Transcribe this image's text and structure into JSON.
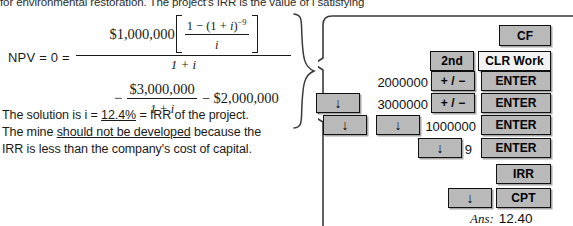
{
  "document": {
    "intro_line": "for environmental restoration. The project's IRR is the value of i satisfying",
    "equation": {
      "lhs": "NPV = 0 =",
      "numerator_coefficient": "$1,000,000",
      "bracket_numerator_prefix": "1 − (1 + ",
      "bracket_numerator_var": "i",
      "bracket_numerator_suffix": ")",
      "bracket_exponent": "−9",
      "bracket_denominator": "i",
      "main_denominator": "1 + i",
      "minus_sign": "−",
      "second_term_numerator": "$3,000,000",
      "second_term_denominator": "1 + i",
      "third_term": "− $2,000,000"
    },
    "conclusion": {
      "line1_prefix": "The solution is i = ",
      "line1_value": "12.4%",
      "line1_suffix": " = IRR of the project.",
      "line2_prefix": "The mine ",
      "line2_emph": "should not be developed",
      "line2_suffix": " because the",
      "line3": "IRR is less than the company's cost of capital."
    }
  },
  "calculator": {
    "rows": [
      {
        "key_labels": [
          "CF"
        ]
      },
      {
        "key_labels": [
          "2nd",
          "CLR Work"
        ]
      },
      {
        "value": "2000000",
        "key_labels": [
          "+ / −",
          "ENTER"
        ]
      },
      {
        "value": "3000000",
        "key_labels": [
          "↓",
          "+ / −",
          "ENTER"
        ]
      },
      {
        "value": "1000000",
        "key_labels": [
          "↓",
          "↓",
          "ENTER"
        ]
      },
      {
        "value": "9",
        "key_labels": [
          "↓",
          "ENTER"
        ]
      },
      {
        "key_labels": [
          "IRR"
        ]
      },
      {
        "key_labels": [
          "↓",
          "CPT"
        ]
      }
    ],
    "keys": {
      "cf": "CF",
      "second": "2nd",
      "clr_work": "CLR Work",
      "plus_minus": "+ / −",
      "enter": "ENTER",
      "down_arrow": "↓",
      "irr": "IRR",
      "cpt": "CPT"
    },
    "values": {
      "cf0": "2000000",
      "cf1": "3000000",
      "cf2": "1000000",
      "freq": "9"
    },
    "answer": {
      "label": "Ans:",
      "value": "12.40"
    }
  },
  "colors": {
    "key_face": "#b9b9b9",
    "key_face_light": "#f2f2f2",
    "key_border": "#111111",
    "ink": "#1a1a1a",
    "page_background": "#ffffff"
  }
}
